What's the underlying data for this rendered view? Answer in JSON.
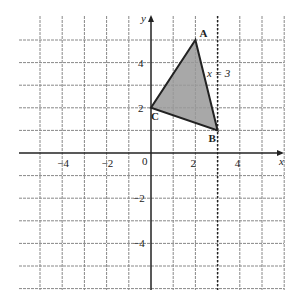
{
  "diagram": {
    "type": "coordinate-grid",
    "axes": {
      "x_label": "x",
      "y_label": "y",
      "origin_label": "0"
    },
    "x_ticks": [
      {
        "v": -4,
        "label": "−4"
      },
      {
        "v": -2,
        "label": "−2"
      },
      {
        "v": 2,
        "label": "2"
      },
      {
        "v": 4,
        "label": "4"
      }
    ],
    "y_ticks": [
      {
        "v": 4,
        "label": "4"
      },
      {
        "v": 2,
        "label": "2"
      },
      {
        "v": -2,
        "label": "−2"
      },
      {
        "v": -4,
        "label": "−4"
      }
    ],
    "triangle": {
      "vertices": [
        {
          "name": "A",
          "x": 2,
          "y": 5
        },
        {
          "name": "B",
          "x": 3,
          "y": 1
        },
        {
          "name": "C",
          "x": 0,
          "y": 2
        }
      ],
      "fill": "#999999"
    },
    "line": {
      "label": "x = 3",
      "x": 3,
      "style": "dotted"
    }
  }
}
